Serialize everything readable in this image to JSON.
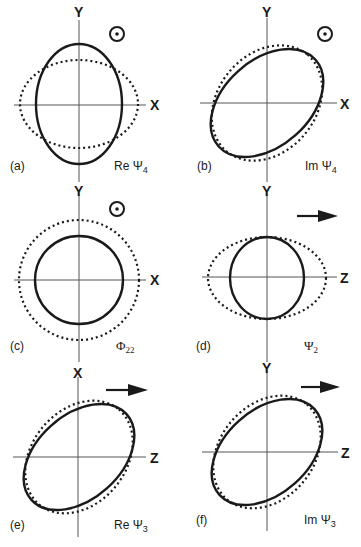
{
  "figure": {
    "colors": {
      "ink": "#1a1a1a",
      "background": "#ffffff"
    },
    "legend": {
      "solid": "solid curve",
      "dotted": "dotted curve"
    },
    "panels": [
      {
        "id": "a",
        "label": "(a)",
        "func": "Re Ψ",
        "func_sub": "4",
        "h_axis": "X",
        "v_axis": "Y",
        "direction_icon": "out-of-page-dot"
      },
      {
        "id": "b",
        "label": "(b)",
        "func": "Im Ψ",
        "func_sub": "4",
        "h_axis": "X",
        "v_axis": "Y",
        "direction_icon": "out-of-page-dot"
      },
      {
        "id": "c",
        "label": "(c)",
        "func": "Φ",
        "func_sub": "22",
        "h_axis": "X",
        "v_axis": "Y",
        "direction_icon": "out-of-page-dot"
      },
      {
        "id": "d",
        "label": "(d)",
        "func": "Ψ",
        "func_sub": "2",
        "h_axis": "Z",
        "v_axis": "Y",
        "direction_icon": "right-arrow"
      },
      {
        "id": "e",
        "label": "(e)",
        "func": "Re Ψ",
        "func_sub": "3",
        "h_axis": "Z",
        "v_axis": "X",
        "direction_icon": "right-arrow"
      },
      {
        "id": "f",
        "label": "(f)",
        "func": "Im Ψ",
        "func_sub": "3",
        "h_axis": "Z",
        "v_axis": "Y",
        "direction_icon": "right-arrow"
      }
    ]
  }
}
